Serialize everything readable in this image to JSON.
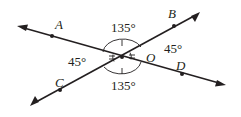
{
  "diagram": {
    "type": "intersecting-lines-angle-diagram",
    "center_point": {
      "label": "O",
      "x": 122,
      "y": 57
    },
    "lines": [
      {
        "name": "line-AD",
        "through": [
          "A",
          "O",
          "D"
        ],
        "start": [
          17,
          26
        ],
        "end": [
          226,
          85
        ]
      },
      {
        "name": "line-CB",
        "through": [
          "C",
          "O",
          "B"
        ],
        "start": [
          30,
          106
        ],
        "end": [
          200,
          12
        ]
      }
    ],
    "points": [
      {
        "label": "A",
        "x": 52,
        "y": 36,
        "label_x": 55,
        "label_y": 29
      },
      {
        "label": "B",
        "x": 174,
        "y": 26,
        "label_x": 168,
        "label_y": 18
      },
      {
        "label": "C",
        "x": 60,
        "y": 90,
        "label_x": 55,
        "label_y": 87
      },
      {
        "label": "D",
        "x": 182,
        "y": 74,
        "label_x": 176,
        "label_y": 70
      }
    ],
    "center_label": {
      "text": "O",
      "x": 146,
      "y": 62
    },
    "angles": [
      {
        "position": "top",
        "value": "135°",
        "x": 111,
        "y": 32,
        "marks": 1
      },
      {
        "position": "bottom",
        "value": "135°",
        "x": 111,
        "y": 90,
        "marks": 1
      },
      {
        "position": "left",
        "value": "45°",
        "x": 68,
        "y": 66,
        "marks": 2
      },
      {
        "position": "right",
        "value": "45°",
        "x": 164,
        "y": 53,
        "marks": 2
      }
    ],
    "colors": {
      "ink": "#231f20",
      "background": "#ffffff"
    }
  }
}
